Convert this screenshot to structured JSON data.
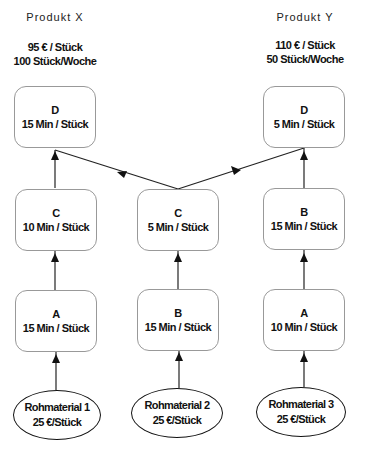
{
  "products": [
    {
      "title": "Produkt X",
      "price": "95 € / Stück",
      "demand": "100 Stück/Woche"
    },
    {
      "title": "Produkt Y",
      "price": "110 € / Stück",
      "demand": "50 Stück/Woche"
    }
  ],
  "steps": {
    "x_d": {
      "name": "D",
      "time": "15 Min / Stück"
    },
    "x_c": {
      "name": "C",
      "time": "10 Min / Stück"
    },
    "x_a": {
      "name": "A",
      "time": "15 Min / Stück"
    },
    "m_c": {
      "name": "C",
      "time": "5 Min / Stück"
    },
    "m_b": {
      "name": "B",
      "time": "15 Min / Stück"
    },
    "y_d": {
      "name": "D",
      "time": "5 Min / Stück"
    },
    "y_b": {
      "name": "B",
      "time": "15 Min / Stück"
    },
    "y_a": {
      "name": "A",
      "time": "10 Min / Stück"
    }
  },
  "raw_materials": [
    {
      "name": "Rohmaterial 1",
      "cost": "25 €/Stück"
    },
    {
      "name": "Rohmaterial 2",
      "cost": "25 €/Stück"
    },
    {
      "name": "Rohmaterial 3",
      "cost": "25 €/Stück"
    }
  ],
  "colors": {
    "line": "#222222",
    "box_border": "#999999"
  }
}
